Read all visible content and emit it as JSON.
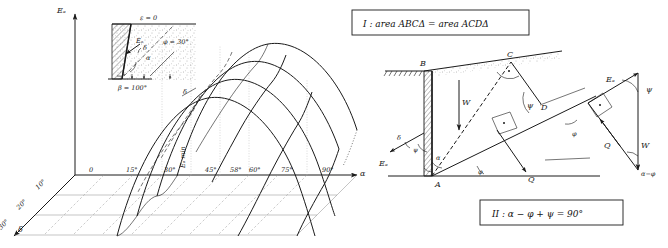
{
  "figure": {
    "title_caption": "",
    "left_panel": {
      "name": "3d-surface-plot-active-earth-pressure",
      "vertical_axis_label": "Eₐ",
      "horizontal_axis_label": "α",
      "depth_axis_label": "δ",
      "alpha_ticks": [
        "0",
        "15°",
        "30°",
        "45°",
        "58°",
        "60°",
        "75°",
        "90°"
      ],
      "delta_ticks": [
        "10°",
        "20°",
        "30°"
      ],
      "minimum_label": "Eₐ min",
      "inset": {
        "name": "retaining-wall-inset",
        "surface_label": "ε = 0",
        "force_label": "Eₐ",
        "angle_delta": "δ",
        "angle_alpha": "α",
        "friction_angle": "φ = 30°",
        "wall_angle": "β = 100°"
      }
    },
    "right_panel": {
      "name": "force-equilibrium-diagram",
      "box_one": "I :  area  ABCΔ = area ACDΔ",
      "box_two": "II :  α − φ + ψ = 90°",
      "points": [
        "A",
        "B",
        "C",
        "D"
      ],
      "forces": {
        "weight": "W",
        "active_pressure": "Eₐ",
        "reaction": "Q"
      },
      "angles": {
        "psi": "ψ",
        "phi": "φ",
        "alpha": "α",
        "delta": "δ",
        "alpha_minus_phi": "α−φ"
      },
      "force_polygon": {
        "name": "force-triangle",
        "sides": [
          "Eₐ",
          "W",
          "Q"
        ],
        "angle_top": "ψ",
        "angle_bottom": "α−φ"
      }
    }
  }
}
